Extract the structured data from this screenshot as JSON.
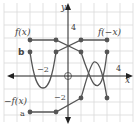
{
  "diagram": {
    "axes": {
      "x_label": "x",
      "y_label": "y",
      "x_tick": "4",
      "x_tick_neg": "−2",
      "y_tick": "4",
      "y_tick_neg": "−2"
    },
    "labels": {
      "f": "f(x)",
      "f_neg_x": "f(−x)",
      "neg_f": "−f(x)",
      "b": "b",
      "a": "a"
    },
    "colors": {
      "grid": "#d9d9d9",
      "axis": "#222222",
      "curve": "#555555",
      "point": "#555555"
    },
    "curves": {
      "f_x": [
        [
          -3,
          3
        ],
        [
          -1,
          3
        ],
        [
          1,
          2
        ],
        [
          3,
          -2
        ]
      ],
      "f_neg_x": [
        [
          -1,
          2
        ],
        [
          1,
          3
        ],
        [
          3,
          3
        ]
      ],
      "neg_f_x": [
        [
          -3,
          -3
        ],
        [
          -1,
          -3
        ],
        [
          1,
          -2
        ],
        [
          3,
          2
        ]
      ],
      "parabola_b": [
        [
          -3,
          2
        ],
        [
          -2,
          -1
        ],
        [
          -1,
          2
        ]
      ]
    }
  }
}
